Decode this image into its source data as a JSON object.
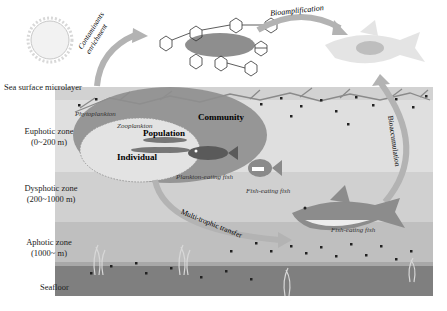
{
  "zones": {
    "surface": "Sea surface microlayer",
    "euphotic": {
      "name": "Euphotic zone",
      "depth": "(0~200 m)"
    },
    "dysphotic": {
      "name": "Dysphotic zone",
      "depth": "(200~1000 m)"
    },
    "aphotic": {
      "name": "Aphotic zone",
      "depth": "(1000~ m)"
    },
    "seafloor": "Seafloor"
  },
  "processes": {
    "enrichment": "Contaminants enrichment",
    "bioamplification": "Bioamplification",
    "bioaccumulation": "Bioaccumulation",
    "multitrophic": "Multi-trophic transfer"
  },
  "organisms": {
    "phytoplankton": "Phytoplankton",
    "zooplankton": "Zooplankton",
    "plankton_fish": "Plankton-eating fish",
    "fish_eating_1": "Fish-eating fish",
    "fish_eating_2": "Fish-eating fish"
  },
  "levels": {
    "community": "Community",
    "population": "Population",
    "individual": "Individual"
  },
  "colors": {
    "surface": "#d4d4d4",
    "euphotic": "#dedede",
    "dysphotic": "#cfcfcf",
    "aphotic": "#bdbdbd",
    "seafloor": "#7e7e7e",
    "community_ellipse": "#8c8c8c",
    "population_ellipse": "#e4e4e4",
    "arrow": "#b5b5b5"
  }
}
